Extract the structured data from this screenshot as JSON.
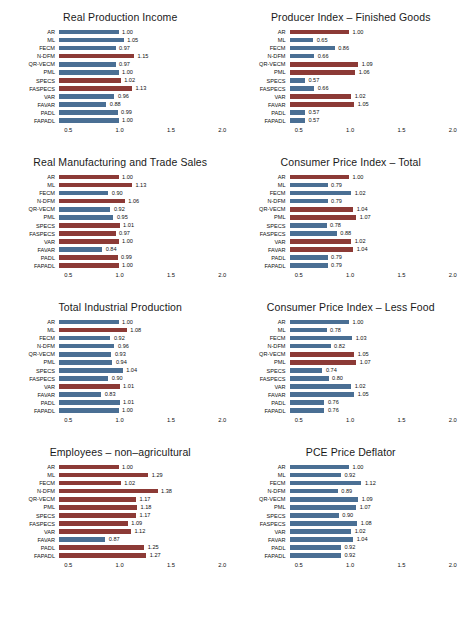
{
  "axis": {
    "ticks": [
      "0.5",
      "1.0",
      "1.5",
      "2.0"
    ],
    "tick_values": [
      0.5,
      1.0,
      1.5,
      2.0
    ],
    "xmin": 0.4,
    "xmax": 2.1
  },
  "colors": {
    "blue": "#4a6f94",
    "red": "#8c3a36",
    "background": "#ffffff",
    "text": "#111111"
  },
  "categories": [
    "AR",
    "ML",
    "FECM",
    "N-DFM",
    "QR-VECM",
    "PML",
    "SPECS",
    "FASPECS",
    "VAR",
    "FAVAR",
    "PADL",
    "FAPADL"
  ],
  "chart_data": [
    {
      "type": "bar",
      "title": "Real Production Income",
      "xlabel": "",
      "ylabel": "",
      "xlim": [
        0.4,
        2.1
      ],
      "grid": false,
      "legend": "none",
      "orientation": "horizontal",
      "categories": [
        "AR",
        "ML",
        "FECM",
        "N-DFM",
        "QR-VECM",
        "PML",
        "SPECS",
        "FASPECS",
        "VAR",
        "FAVAR",
        "PADL",
        "FAPADL"
      ],
      "values": [
        1.0,
        1.05,
        0.97,
        1.15,
        0.97,
        1.0,
        1.02,
        1.13,
        0.96,
        0.88,
        0.99,
        1.0
      ],
      "labels": [
        "1.00",
        "1.05",
        "0.97",
        "1.15",
        "0.97",
        "1.00",
        "1.02",
        "1.13",
        "0.96",
        "0.88",
        "0.99",
        "1.00"
      ],
      "bar_colors": [
        "blue",
        "blue",
        "blue",
        "red",
        "blue",
        "blue",
        "red",
        "red",
        "blue",
        "blue",
        "blue",
        "blue"
      ]
    },
    {
      "type": "bar",
      "title": "Producer Index – Finished Goods",
      "xlabel": "",
      "ylabel": "",
      "xlim": [
        0.4,
        2.1
      ],
      "grid": false,
      "legend": "none",
      "orientation": "horizontal",
      "categories": [
        "AR",
        "ML",
        "FECM",
        "N-DFM",
        "QR-VECM",
        "PML",
        "SPECS",
        "FASPECS",
        "VAR",
        "FAVAR",
        "PADL",
        "FAPADL"
      ],
      "values": [
        1.0,
        0.65,
        0.86,
        0.66,
        1.09,
        1.06,
        0.57,
        0.66,
        1.02,
        1.05,
        0.57,
        0.57
      ],
      "labels": [
        "1.00",
        "0.65",
        "0.86",
        "0.66",
        "1.09",
        "1.06",
        "0.57",
        "0.66",
        "1.02",
        "1.05",
        "0.57",
        "0.57"
      ],
      "bar_colors": [
        "red",
        "blue",
        "blue",
        "blue",
        "red",
        "red",
        "blue",
        "blue",
        "red",
        "red",
        "blue",
        "blue"
      ]
    },
    {
      "type": "bar",
      "title": "Real Manufacturing and Trade Sales",
      "xlabel": "",
      "ylabel": "",
      "xlim": [
        0.4,
        2.1
      ],
      "grid": false,
      "legend": "none",
      "orientation": "horizontal",
      "categories": [
        "AR",
        "ML",
        "FECM",
        "N-DFM",
        "QR-VECM",
        "PML",
        "SPECS",
        "FASPECS",
        "VAR",
        "FAVAR",
        "PADL",
        "FAPADL"
      ],
      "values": [
        1.0,
        1.13,
        0.9,
        1.06,
        0.92,
        0.95,
        1.01,
        0.97,
        1.0,
        0.84,
        0.99,
        1.0
      ],
      "labels": [
        "1.00",
        "1.13",
        "0.90",
        "1.06",
        "0.92",
        "0.95",
        "1.01",
        "0.97",
        "1.00",
        "0.84",
        "0.99",
        "1.00"
      ],
      "bar_colors": [
        "red",
        "red",
        "blue",
        "red",
        "blue",
        "blue",
        "red",
        "red",
        "red",
        "blue",
        "red",
        "red"
      ]
    },
    {
      "type": "bar",
      "title": "Consumer Price Index – Total",
      "xlabel": "",
      "ylabel": "",
      "xlim": [
        0.4,
        2.1
      ],
      "grid": false,
      "legend": "none",
      "orientation": "horizontal",
      "categories": [
        "AR",
        "ML",
        "FECM",
        "N-DFM",
        "QR-VECM",
        "PML",
        "SPECS",
        "FASPECS",
        "VAR",
        "FAVAR",
        "PADL",
        "FAPADL"
      ],
      "values": [
        1.0,
        0.79,
        1.02,
        0.79,
        1.04,
        1.07,
        0.78,
        0.88,
        1.02,
        1.04,
        0.79,
        0.79
      ],
      "labels": [
        "1.00",
        "0.79",
        "1.02",
        "0.79",
        "1.04",
        "1.07",
        "0.78",
        "0.88",
        "1.02",
        "1.04",
        "0.79",
        "0.79"
      ],
      "bar_colors": [
        "red",
        "blue",
        "blue",
        "blue",
        "red",
        "red",
        "blue",
        "blue",
        "red",
        "red",
        "blue",
        "blue"
      ]
    },
    {
      "type": "bar",
      "title": "Total Industrial Production",
      "xlabel": "",
      "ylabel": "",
      "xlim": [
        0.4,
        2.1
      ],
      "grid": false,
      "legend": "none",
      "orientation": "horizontal",
      "categories": [
        "AR",
        "ML",
        "FECM",
        "N-DFM",
        "QR-VECM",
        "PML",
        "SPECS",
        "FASPECS",
        "VAR",
        "FAVAR",
        "PADL",
        "FAPADL"
      ],
      "values": [
        1.0,
        1.08,
        0.92,
        0.96,
        0.93,
        0.94,
        1.04,
        0.9,
        1.01,
        0.83,
        1.01,
        1.0
      ],
      "labels": [
        "1.00",
        "1.08",
        "0.92",
        "0.96",
        "0.93",
        "0.94",
        "1.04",
        "0.90",
        "1.01",
        "0.83",
        "1.01",
        "1.00"
      ],
      "bar_colors": [
        "blue",
        "red",
        "blue",
        "blue",
        "blue",
        "blue",
        "blue",
        "blue",
        "red",
        "blue",
        "blue",
        "blue"
      ]
    },
    {
      "type": "bar",
      "title": "Consumer Price Index – Less Food",
      "xlabel": "",
      "ylabel": "",
      "xlim": [
        0.4,
        2.1
      ],
      "grid": false,
      "legend": "none",
      "orientation": "horizontal",
      "categories": [
        "AR",
        "ML",
        "FECM",
        "N-DFM",
        "QR-VECM",
        "PML",
        "SPECS",
        "FASPECS",
        "VAR",
        "FAVAR",
        "PADL",
        "FAPADL"
      ],
      "values": [
        1.0,
        0.78,
        1.03,
        0.82,
        1.05,
        1.07,
        0.74,
        0.8,
        1.02,
        1.05,
        0.76,
        0.76
      ],
      "labels": [
        "1.00",
        "0.78",
        "1.03",
        "0.82",
        "1.05",
        "1.07",
        "0.74",
        "0.80",
        "1.02",
        "1.05",
        "0.76",
        "0.76"
      ],
      "bar_colors": [
        "blue",
        "blue",
        "blue",
        "blue",
        "red",
        "red",
        "blue",
        "blue",
        "blue",
        "blue",
        "blue",
        "blue"
      ]
    },
    {
      "type": "bar",
      "title": "Employees – non–agricultural",
      "xlabel": "",
      "ylabel": "",
      "xlim": [
        0.4,
        2.1
      ],
      "grid": false,
      "legend": "none",
      "orientation": "horizontal",
      "categories": [
        "AR",
        "ML",
        "FECM",
        "N-DFM",
        "QR-VECM",
        "PML",
        "SPECS",
        "FASPECS",
        "VAR",
        "FAVAR",
        "PADL",
        "FAPADL"
      ],
      "values": [
        1.0,
        1.29,
        1.02,
        1.38,
        1.17,
        1.18,
        1.17,
        1.09,
        1.12,
        0.87,
        1.25,
        1.27
      ],
      "labels": [
        "1.00",
        "1.29",
        "1.02",
        "1.38",
        "1.17",
        "1.18",
        "1.17",
        "1.09",
        "1.12",
        "0.87",
        "1.25",
        "1.27"
      ],
      "bar_colors": [
        "red",
        "red",
        "red",
        "red",
        "red",
        "red",
        "red",
        "red",
        "red",
        "blue",
        "red",
        "red"
      ]
    },
    {
      "type": "bar",
      "title": "PCE Price Deflator",
      "xlabel": "",
      "ylabel": "",
      "xlim": [
        0.4,
        2.1
      ],
      "grid": false,
      "legend": "none",
      "orientation": "horizontal",
      "categories": [
        "AR",
        "ML",
        "FECM",
        "N-DFM",
        "QR-VECM",
        "PML",
        "SPECS",
        "FASPECS",
        "VAR",
        "FAVAR",
        "PADL",
        "FAPADL"
      ],
      "values": [
        1.0,
        0.92,
        1.12,
        0.89,
        1.09,
        1.07,
        0.9,
        1.08,
        1.02,
        1.04,
        0.92,
        0.92
      ],
      "labels": [
        "1.00",
        "0.92",
        "1.12",
        "0.89",
        "1.09",
        "1.07",
        "0.90",
        "1.08",
        "1.02",
        "1.04",
        "0.92",
        "0.92"
      ],
      "bar_colors": [
        "blue",
        "blue",
        "blue",
        "blue",
        "blue",
        "blue",
        "blue",
        "blue",
        "blue",
        "blue",
        "blue",
        "blue"
      ]
    }
  ]
}
